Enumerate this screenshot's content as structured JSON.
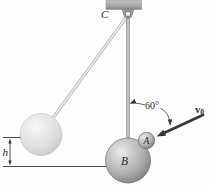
{
  "diagram": {
    "labels": {
      "pivot": "C",
      "ball_b": "B",
      "ball_a": "A",
      "height": "h",
      "angle": "60°",
      "velocity_base": "v",
      "velocity_sub": "0"
    },
    "colors": {
      "metal_light": "#ededed",
      "metal_mid": "#b0b0b0",
      "metal_dark": "#747474",
      "ghost_light": "#f4f4f4",
      "ghost_dark": "#bcbcbc",
      "support_fill": "#a9a9a9",
      "ink": "#383838"
    }
  }
}
